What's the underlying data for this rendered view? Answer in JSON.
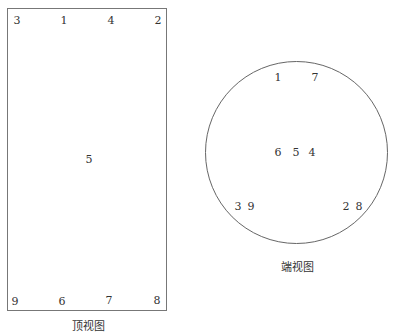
{
  "top_view": {
    "caption": "顶视图",
    "labels": [
      {
        "text": "3",
        "x": 17,
        "y": 21
      },
      {
        "text": "1",
        "x": 64,
        "y": 21
      },
      {
        "text": "4",
        "x": 111,
        "y": 21
      },
      {
        "text": "2",
        "x": 158,
        "y": 21
      },
      {
        "text": "5",
        "x": 89,
        "y": 160
      },
      {
        "text": "9",
        "x": 15,
        "y": 302
      },
      {
        "text": "6",
        "x": 62,
        "y": 302
      },
      {
        "text": "7",
        "x": 109,
        "y": 301
      },
      {
        "text": "8",
        "x": 157,
        "y": 301
      }
    ]
  },
  "end_view": {
    "caption": "端视图",
    "labels": [
      {
        "text": "1",
        "x": 278,
        "y": 78
      },
      {
        "text": "7",
        "x": 315,
        "y": 78
      },
      {
        "text": "6",
        "x": 278,
        "y": 153
      },
      {
        "text": "5",
        "x": 296,
        "y": 153
      },
      {
        "text": "4",
        "x": 312,
        "y": 153
      },
      {
        "text": "3",
        "x": 238,
        "y": 207
      },
      {
        "text": "9",
        "x": 251,
        "y": 207
      },
      {
        "text": "2",
        "x": 346,
        "y": 207
      },
      {
        "text": "8",
        "x": 359,
        "y": 207
      }
    ]
  }
}
